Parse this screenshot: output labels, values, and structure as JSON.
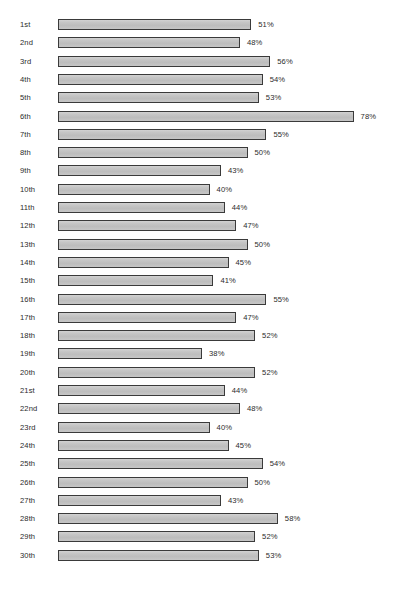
{
  "chart_data": {
    "type": "bar",
    "orientation": "horizontal",
    "title": "",
    "subtitle": "",
    "xlabel": "",
    "ylabel": "",
    "xlim": [
      0,
      80
    ],
    "grid": false,
    "legend": null,
    "value_suffix": "%",
    "categories": [
      "1st",
      "2nd",
      "3rd",
      "4th",
      "5th",
      "6th",
      "7th",
      "8th",
      "9th",
      "10th",
      "11th",
      "12th",
      "13th",
      "14th",
      "15th",
      "16th",
      "17th",
      "18th",
      "19th",
      "20th",
      "21st",
      "22nd",
      "23rd",
      "24th",
      "25th",
      "26th",
      "27th",
      "28th",
      "29th",
      "30th"
    ],
    "values": [
      51,
      48,
      56,
      54,
      53,
      78,
      55,
      50,
      43,
      40,
      44,
      47,
      50,
      45,
      41,
      55,
      47,
      52,
      38,
      52,
      44,
      48,
      40,
      45,
      54,
      50,
      43,
      58,
      52,
      53
    ],
    "data_labels": [
      "51%",
      "48%",
      "56%",
      "54%",
      "53%",
      "78%",
      "55%",
      "50%",
      "43%",
      "40%",
      "44%",
      "47%",
      "50%",
      "45%",
      "41%",
      "55%",
      "47%",
      "52%",
      "38%",
      "52%",
      "44%",
      "48%",
      "40%",
      "45%",
      "54%",
      "50%",
      "43%",
      "58%",
      "52%",
      "53%"
    ],
    "bar_fill_color": "#c3c3c3",
    "bar_border_color": "#3a3a3a",
    "background_color": "#ffffff",
    "text_color": "#2b2b2b"
  },
  "layout": {
    "bar_origin_x": 58,
    "px_per_percent": 3.79,
    "first_row_y": 18,
    "row_pitch": 18.3,
    "bar_height": 11,
    "value_gap": 7
  }
}
